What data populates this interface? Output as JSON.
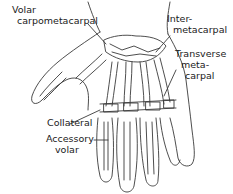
{
  "diagram": {
    "labels": [
      {
        "id": "volar-carpometacarpal",
        "line1": "Volar",
        "line2": "carpometacarpal"
      },
      {
        "id": "intermetacarpal",
        "line1": "Inter-",
        "line2": "metacarpal"
      },
      {
        "id": "transverse-metacarpal",
        "line1": "Transverse",
        "line2": "meta-",
        "line3": "carpal"
      },
      {
        "id": "collateral",
        "line1": "Collateral"
      },
      {
        "id": "accessory-volar",
        "line1": "Accessory",
        "line2": "volar"
      }
    ],
    "colors": {
      "line": "#333333",
      "background": "#ffffff"
    }
  }
}
